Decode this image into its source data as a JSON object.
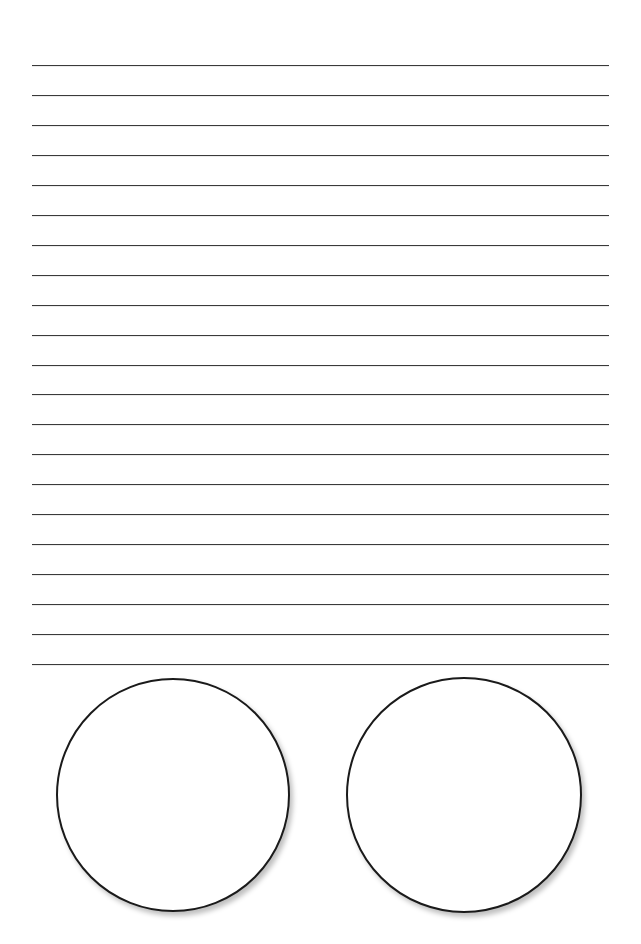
{
  "page": {
    "type": "lined-writing-worksheet",
    "background_color": "#ffffff",
    "line_color": "#3a3a3a",
    "circle_border_color": "#1a1a1a"
  },
  "ruled_lines": {
    "count": 21,
    "left": 32,
    "right": 609,
    "first_y": 65,
    "last_y": 664,
    "spacing": 29.95
  },
  "circles": [
    {
      "id": "left",
      "cx": 173,
      "cy": 795,
      "r": 117
    },
    {
      "id": "right",
      "cx": 464,
      "cy": 795,
      "r": 118
    }
  ]
}
